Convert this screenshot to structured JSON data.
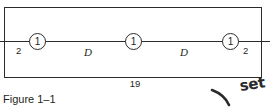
{
  "figure": {
    "caption": "Figure 1–1",
    "outline_name": "beam-outline",
    "nodes": [
      {
        "label": "1"
      },
      {
        "label": "1"
      },
      {
        "label": "1"
      }
    ],
    "edge_dimensions": {
      "left": "2",
      "right": "2"
    },
    "span_labels": [
      "D",
      "D"
    ],
    "overall_dimension": "19"
  },
  "annotation": {
    "handwritten_text": "set",
    "stroke_name": "curved-pen-stroke"
  },
  "colors": {
    "ink": "#231f20",
    "line": "#2b2b2b",
    "paper": "#ffffff",
    "handwriting": "#2a2a2a"
  }
}
